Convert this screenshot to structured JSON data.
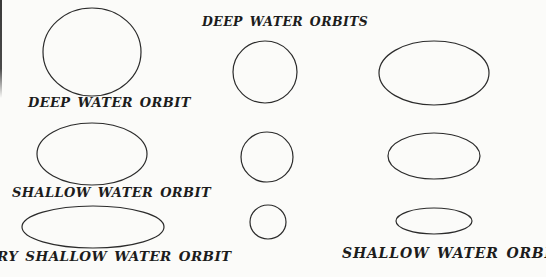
{
  "style": {
    "background": "#fbfbf9",
    "stroke": "#2b2b2b",
    "stroke_width": 1.2,
    "text_color": "#1c1c1c"
  },
  "labels": {
    "deep_water_orbit": "DEEP WATER ORBIT",
    "shallow_water_orbit": "SHALLOW WATER ORBIT",
    "very_shallow_water_orbit": "RY SHALLOW WATER ORBIT",
    "deep_water_orbits": "DEEP WATER ORBITS",
    "shallow_water_orbits": "SHALLOW WATER ORBITS"
  },
  "shapes": [
    {
      "name": "deep-water-orbit-circle",
      "cx": 92,
      "cy": 52,
      "rx": 49,
      "ry": 44
    },
    {
      "name": "shallow-water-orbit-ellipse",
      "cx": 92,
      "cy": 154,
      "rx": 55,
      "ry": 31
    },
    {
      "name": "very-shallow-water-orbit-ellipse",
      "cx": 93,
      "cy": 227,
      "rx": 71,
      "ry": 21
    },
    {
      "name": "deep-orbits-large-circle",
      "cx": 265,
      "cy": 72,
      "rx": 32,
      "ry": 31
    },
    {
      "name": "deep-orbits-medium-circle",
      "cx": 267,
      "cy": 157,
      "rx": 26,
      "ry": 25
    },
    {
      "name": "deep-orbits-small-circle",
      "cx": 268,
      "cy": 222,
      "rx": 18,
      "ry": 17
    },
    {
      "name": "shallow-orbits-large-ellipse",
      "cx": 434,
      "cy": 73,
      "rx": 55,
      "ry": 32
    },
    {
      "name": "shallow-orbits-medium-ellipse",
      "cx": 434,
      "cy": 156,
      "rx": 46,
      "ry": 23
    },
    {
      "name": "shallow-orbits-small-ellipse",
      "cx": 434,
      "cy": 221,
      "rx": 38,
      "ry": 13
    }
  ]
}
